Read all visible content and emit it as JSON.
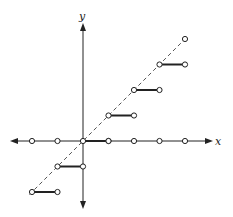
{
  "diagram": {
    "axes": {
      "x_label": "x",
      "y_label": "y",
      "origin_px": [
        83,
        141
      ],
      "unit_px": 25.5
    },
    "colors": {
      "line": "#222222",
      "dashed": "#555555",
      "point_fill": "#ffffff"
    },
    "x_axis_points": [
      -2,
      -1,
      1,
      2,
      3,
      4
    ],
    "steps": [
      {
        "y": -2,
        "x_start": -2,
        "x_end": -1
      },
      {
        "y": -1,
        "x_start": -1,
        "x_end": 0
      },
      {
        "y": 0,
        "x_start": 0,
        "x_end": 1
      },
      {
        "y": 1,
        "x_start": 1,
        "x_end": 2
      },
      {
        "y": 2,
        "x_start": 2,
        "x_end": 3
      },
      {
        "y": 3,
        "x_start": 3,
        "x_end": 4
      }
    ],
    "extra_points": [
      {
        "x": 4,
        "y": 4
      }
    ],
    "dashed_line": "y = x"
  }
}
